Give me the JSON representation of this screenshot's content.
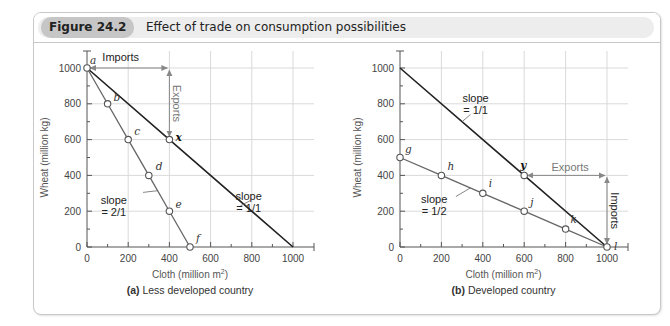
{
  "figure": {
    "number_label": "Figure 24.2",
    "title": "Effect of trade on consumption possibilities"
  },
  "colors": {
    "grid": "#d9d9d9",
    "axis": "#555555",
    "trade_line": "#222222",
    "ppf_line": "#666666",
    "arrow": "#888888",
    "badge_bg": "#c6c6c6"
  },
  "chart_data": [
    {
      "type": "line",
      "panel_id": "a",
      "title_prefix": "(a)",
      "title": "Less developed country",
      "xlabel": "Cloth (million m²)",
      "ylabel": "Wheat (million kg)",
      "xlim": [
        0,
        1100
      ],
      "ylim": [
        0,
        1100
      ],
      "xticks": [
        0,
        200,
        400,
        600,
        800,
        1000
      ],
      "yticks": [
        0,
        200,
        400,
        600,
        800,
        1000
      ],
      "grid": true,
      "series": [
        {
          "name": "production possibility (slope 2/1)",
          "style": "ppf",
          "points": [
            {
              "x": 0,
              "y": 1000,
              "label": "a"
            },
            {
              "x": 100,
              "y": 800,
              "label": "b"
            },
            {
              "x": 200,
              "y": 600,
              "label": "c"
            },
            {
              "x": 300,
              "y": 400,
              "label": "d"
            },
            {
              "x": 400,
              "y": 200,
              "label": "e"
            },
            {
              "x": 500,
              "y": 0,
              "label": "f"
            }
          ]
        },
        {
          "name": "consumption possibility with trade (slope 1/1)",
          "style": "trade",
          "points": [
            {
              "x": 0,
              "y": 1000
            },
            {
              "x": 400,
              "y": 600,
              "label": "x",
              "bold": true
            },
            {
              "x": 1000,
              "y": 0
            }
          ]
        }
      ],
      "annotations": [
        {
          "text": "Imports",
          "kind": "horizontal-arrow",
          "from": [
            0,
            1000
          ],
          "to": [
            400,
            1000
          ]
        },
        {
          "text": "Exports",
          "kind": "vertical-arrow",
          "from": [
            400,
            1000
          ],
          "to": [
            400,
            600
          ]
        },
        {
          "text_lines": [
            "slope",
            "= 2/1"
          ],
          "kind": "slope-label",
          "series": 0
        },
        {
          "text_lines": [
            "slope",
            "= 1/1"
          ],
          "kind": "slope-label",
          "series": 1
        }
      ]
    },
    {
      "type": "line",
      "panel_id": "b",
      "title_prefix": "(b)",
      "title": "Developed country",
      "xlabel": "Cloth (million m²)",
      "ylabel": "Wheat (million kg)",
      "xlim": [
        0,
        1100
      ],
      "ylim": [
        0,
        1100
      ],
      "xticks": [
        0,
        200,
        400,
        600,
        800,
        1000
      ],
      "yticks": [
        0,
        200,
        400,
        600,
        800,
        1000
      ],
      "grid": true,
      "series": [
        {
          "name": "production possibility (slope 1/2)",
          "style": "ppf",
          "points": [
            {
              "x": 0,
              "y": 500,
              "label": "g"
            },
            {
              "x": 200,
              "y": 400,
              "label": "h"
            },
            {
              "x": 400,
              "y": 300,
              "label": "i"
            },
            {
              "x": 600,
              "y": 200,
              "label": "j"
            },
            {
              "x": 800,
              "y": 100,
              "label": "k"
            },
            {
              "x": 1000,
              "y": 0,
              "label": "l"
            }
          ]
        },
        {
          "name": "consumption possibility with trade (slope 1/1)",
          "style": "trade",
          "points": [
            {
              "x": 0,
              "y": 1000
            },
            {
              "x": 600,
              "y": 400,
              "label": "y",
              "bold": true
            },
            {
              "x": 1000,
              "y": 0
            }
          ]
        }
      ],
      "annotations": [
        {
          "text": "Exports",
          "kind": "horizontal-arrow",
          "from": [
            600,
            400
          ],
          "to": [
            1000,
            400
          ]
        },
        {
          "text": "Imports",
          "kind": "vertical-arrow",
          "from": [
            1000,
            400
          ],
          "to": [
            1000,
            0
          ]
        },
        {
          "text_lines": [
            "slope",
            "= 1/2"
          ],
          "kind": "slope-label",
          "series": 0
        },
        {
          "text_lines": [
            "slope",
            "= 1/1"
          ],
          "kind": "slope-label",
          "series": 1
        }
      ]
    }
  ]
}
